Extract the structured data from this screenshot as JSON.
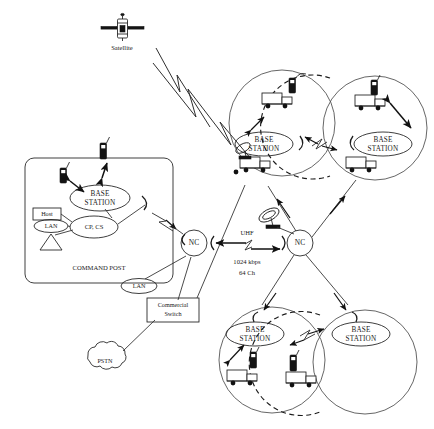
{
  "diagram": {
    "background_color": "#ffffff",
    "line_color": "#1c1c1c"
  },
  "satellite": {
    "label": "Satellite",
    "icon": "satellite-icon"
  },
  "command_post": {
    "label": "COMMAND POST",
    "base_station": "BASE\nSTATION",
    "base_station_line1": "BASE",
    "base_station_line2": "STATION",
    "host": "Host",
    "lan": "LAN",
    "cp_cs": "CP, CS",
    "terminal_icon": "terminal-triangle-icon",
    "handset_icon": "handheld-radio-icon"
  },
  "external_lan": {
    "label": "LAN"
  },
  "commercial_switch": {
    "label_line1": "Commercial",
    "label_line2": "Switch"
  },
  "pstn": {
    "label": "PSTN"
  },
  "nodes": {
    "nc_left": "NC",
    "nc_right": "NC"
  },
  "uhf_link": {
    "band": "UHF",
    "rate": "1024 kbps",
    "channels": "64 Ch"
  },
  "dish": {
    "icon": "satellite-dish-icon"
  },
  "cells": [
    {
      "id": "cell-top-left",
      "base_station_line1": "BASE",
      "base_station_line2": "STATION",
      "vehicles": 2,
      "handsets": 1
    },
    {
      "id": "cell-top-right",
      "base_station_line1": "BASE",
      "base_station_line2": "STATION",
      "vehicles": 2,
      "handsets": 1
    },
    {
      "id": "cell-bottom-left",
      "base_station_line1": "BASE",
      "base_station_line2": "STATION",
      "vehicles": 1,
      "handsets": 1
    },
    {
      "id": "cell-bottom-right",
      "base_station_line1": "BASE",
      "base_station_line2": "STATION",
      "vehicles": 1,
      "handsets": 1
    }
  ]
}
